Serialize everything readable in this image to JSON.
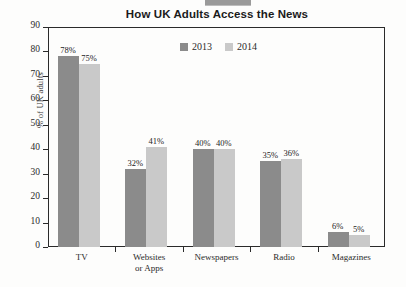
{
  "chart_data": {
    "type": "bar",
    "title": "How UK Adults Access the News",
    "xlabel": "",
    "ylabel": "% of UK adults",
    "ylim": [
      0,
      90
    ],
    "ytick_step": 10,
    "yticks": [
      90,
      80,
      70,
      60,
      50,
      40,
      30,
      20,
      10,
      0
    ],
    "grid": false,
    "legend_position": "top-center",
    "categories": [
      "TV",
      "Websites or Apps",
      "Newspapers",
      "Radio",
      "Magazines"
    ],
    "category_lines": [
      [
        "TV",
        ""
      ],
      [
        "Websites",
        "or Apps"
      ],
      [
        "Newspapers",
        ""
      ],
      [
        "Radio",
        ""
      ],
      [
        "Magazines",
        ""
      ]
    ],
    "series": [
      {
        "name": "2013",
        "color": "#8b8b8b",
        "values": [
          78,
          32,
          40,
          35,
          6
        ],
        "labels": [
          "78%",
          "32%",
          "40%",
          "35%",
          "6%"
        ]
      },
      {
        "name": "2014",
        "color": "#c9c9c9",
        "values": [
          75,
          41,
          40,
          36,
          5
        ],
        "labels": [
          "75%",
          "41%",
          "40%",
          "36%",
          "5%"
        ]
      }
    ]
  },
  "legend": {
    "items": [
      {
        "label": "2013",
        "color": "#8b8b8b"
      },
      {
        "label": "2014",
        "color": "#c9c9c9"
      }
    ]
  },
  "axis": {
    "y_title": "% of UK adults",
    "y_labels": [
      "90",
      "80",
      "70",
      "60",
      "50",
      "40",
      "30",
      "20",
      "10",
      "0"
    ]
  },
  "colors": {
    "series_2013": "#8b8b8b",
    "series_2014": "#c9c9c9",
    "axis": "#2a2a2a",
    "background": "#fdfdfc"
  }
}
